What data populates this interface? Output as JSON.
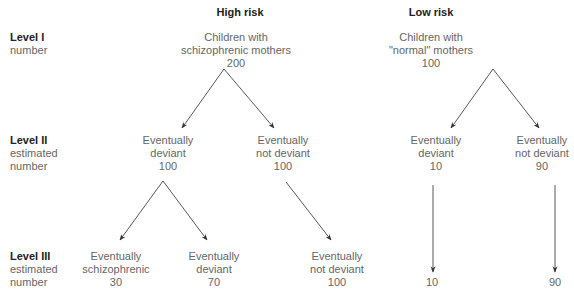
{
  "headers": {
    "high_risk": "High risk",
    "low_risk": "Low risk"
  },
  "levels": [
    {
      "name": "Level I",
      "sub1": "number",
      "sub2": ""
    },
    {
      "name": "Level II",
      "sub1": "estimated",
      "sub2": "number"
    },
    {
      "name": "Level III",
      "sub1": "estimated",
      "sub2": "number"
    }
  ],
  "nodes": {
    "l1_high": {
      "line1": "Children with",
      "line2": "schizophrenic mothers",
      "value": "200"
    },
    "l1_low": {
      "line1": "Children with",
      "line2": "\"normal\" mothers",
      "value": "100"
    },
    "l2_high_deviant": {
      "line1": "Eventually",
      "line2": "deviant",
      "value": "100"
    },
    "l2_high_not_deviant": {
      "line1": "Eventually",
      "line2": "not deviant",
      "value": "100"
    },
    "l2_low_deviant": {
      "line1": "Eventually",
      "line2": "deviant",
      "value": "10"
    },
    "l2_low_not_deviant": {
      "line1": "Eventually",
      "line2": "not deviant",
      "value": "90"
    },
    "l3_high_schizophrenic": {
      "line1": "Eventually",
      "line2": "schizophrenic",
      "value": "30"
    },
    "l3_high_deviant": {
      "line1": "Eventually",
      "line2": "deviant",
      "value": "70"
    },
    "l3_high_not_deviant": {
      "line1": "Eventually",
      "line2": "not deviant",
      "value": "100"
    },
    "l3_low_deviant": {
      "value": "10"
    },
    "l3_low_not_deviant": {
      "value": "90"
    }
  },
  "colors": {
    "line": "#444444",
    "text": "#666666",
    "heading": "#222222"
  }
}
